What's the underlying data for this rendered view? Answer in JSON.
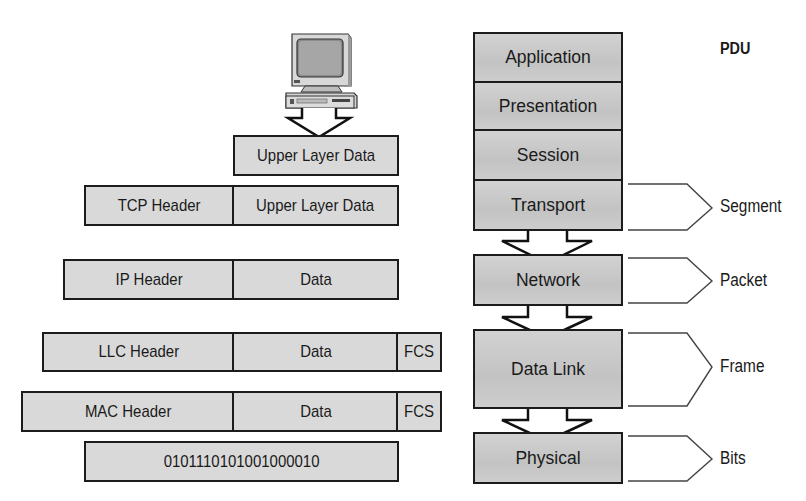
{
  "figure": {
    "pdu_heading": "PDU"
  },
  "encapsulation": {
    "upper_layer": {
      "data": "Upper Layer Data"
    },
    "tcp": {
      "header": "TCP Header",
      "data": "Upper Layer Data"
    },
    "ip": {
      "header": "IP Header",
      "data": "Data"
    },
    "llc": {
      "header": "LLC Header",
      "data": "Data",
      "trailer": "FCS"
    },
    "mac": {
      "header": "MAC Header",
      "data": "Data",
      "trailer": "FCS"
    },
    "bits": {
      "value": "0101110101001000010"
    }
  },
  "osi_layers": [
    {
      "name": "Application"
    },
    {
      "name": "Presentation"
    },
    {
      "name": "Session"
    },
    {
      "name": "Transport"
    },
    {
      "name": "Network"
    },
    {
      "name": "Data Link"
    },
    {
      "name": "Physical"
    }
  ],
  "pdus": [
    {
      "layer": "Transport",
      "label": "Segment"
    },
    {
      "layer": "Network",
      "label": "Packet"
    },
    {
      "layer": "Data Link",
      "label": "Frame"
    },
    {
      "layer": "Physical",
      "label": "Bits"
    }
  ],
  "icons": {
    "computer": "desktop-computer-icon",
    "arrow": "down-arrow-icon",
    "bracket": "chevron-bracket-icon"
  },
  "colors": {
    "box_fill": "#d9d9d9",
    "stack_fill": "#c8c8c8",
    "border": "#1c1c1c",
    "background": "#ffffff"
  }
}
